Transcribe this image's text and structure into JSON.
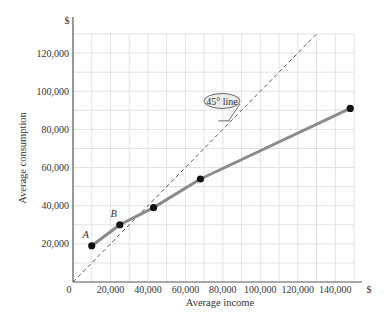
{
  "chart_data": {
    "type": "line",
    "title": "",
    "xlabel": "Average income",
    "ylabel": "Average consumption",
    "x_unit_label": "$",
    "y_unit_label": "$",
    "xlim": [
      0,
      150000
    ],
    "ylim": [
      0,
      130000
    ],
    "grid": true,
    "x_ticks": [
      0,
      20000,
      40000,
      60000,
      80000,
      100000,
      120000,
      140000
    ],
    "x_tick_labels": [
      "0",
      "20,000",
      "40,000",
      "60,000",
      "80,000",
      "100,000",
      "120,000",
      "140,000"
    ],
    "y_ticks": [
      20000,
      40000,
      60000,
      80000,
      100000,
      120000
    ],
    "y_tick_labels": [
      "20,000",
      "40,000",
      "60,000",
      "80,000",
      "100,000",
      "120,000"
    ],
    "series": [
      {
        "name": "Average consumption",
        "color": "#8a8a8a",
        "points": [
          {
            "x": 10000,
            "y": 19000,
            "label": "A"
          },
          {
            "x": 25000,
            "y": 30000,
            "label": "B"
          },
          {
            "x": 43000,
            "y": 39000,
            "label": ""
          },
          {
            "x": 68000,
            "y": 54000,
            "label": ""
          },
          {
            "x": 148000,
            "y": 91000,
            "label": ""
          }
        ]
      }
    ],
    "reference_line": {
      "name": "45° line",
      "label": "45° line",
      "from": [
        0,
        0
      ],
      "to": [
        130000,
        130000
      ],
      "style": "dashed"
    }
  }
}
